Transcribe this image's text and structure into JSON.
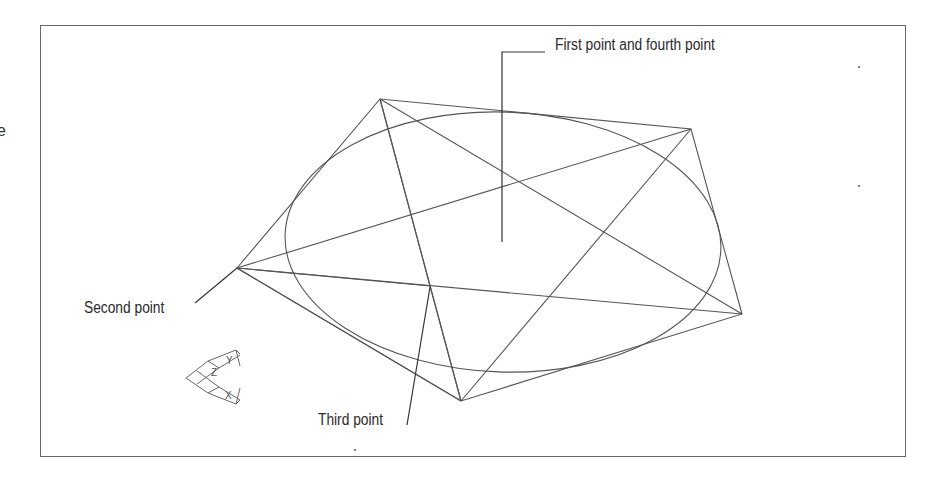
{
  "page": {
    "clipped_left_text": "e"
  },
  "labels": {
    "first_fourth": "First point and fourth point",
    "second": "Second point",
    "third": "Third point"
  },
  "ucs_icon": {
    "y_axis": "Y",
    "x_axis": "X",
    "z_axis": "Z"
  },
  "geometry": {
    "vertices": {
      "top_left": [
        380,
        99
      ],
      "top_right": [
        691,
        129
      ],
      "right": [
        742,
        314
      ],
      "bottom": [
        461,
        401
      ],
      "second_point": [
        237,
        268
      ],
      "third_point": [
        430,
        286
      ]
    },
    "ellipse": {
      "cx": 503,
      "cy": 242,
      "rx": 218,
      "ry": 130
    }
  },
  "colors": {
    "line": "#555555",
    "text": "#2a2a2a",
    "frame": "#666666"
  }
}
